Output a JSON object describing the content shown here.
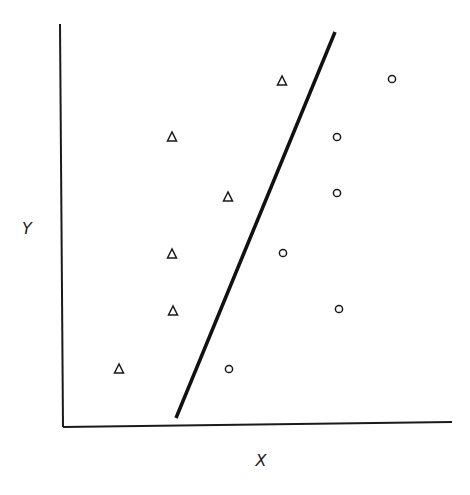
{
  "chart_data": {
    "type": "scatter",
    "title": "",
    "xlabel": "X",
    "ylabel": "Y",
    "grid": false,
    "legend": null,
    "series": [
      {
        "name": "class-triangle",
        "marker": "triangle",
        "points": [
          {
            "x": 282,
            "y": 81
          },
          {
            "x": 172,
            "y": 137
          },
          {
            "x": 228,
            "y": 197
          },
          {
            "x": 172,
            "y": 254
          },
          {
            "x": 173,
            "y": 311
          },
          {
            "x": 119,
            "y": 369
          }
        ]
      },
      {
        "name": "class-circle",
        "marker": "circle",
        "points": [
          {
            "x": 392,
            "y": 79
          },
          {
            "x": 337,
            "y": 137
          },
          {
            "x": 337,
            "y": 193
          },
          {
            "x": 283,
            "y": 253
          },
          {
            "x": 339,
            "y": 309
          },
          {
            "x": 229,
            "y": 369
          }
        ]
      }
    ],
    "decision_boundary": {
      "x1": 176,
      "y1": 418,
      "x2": 335,
      "y2": 32
    }
  },
  "labels": {
    "x": "X",
    "y": "Y"
  },
  "colors": {
    "ink": "#1a1a1a",
    "background": "#ffffff"
  }
}
